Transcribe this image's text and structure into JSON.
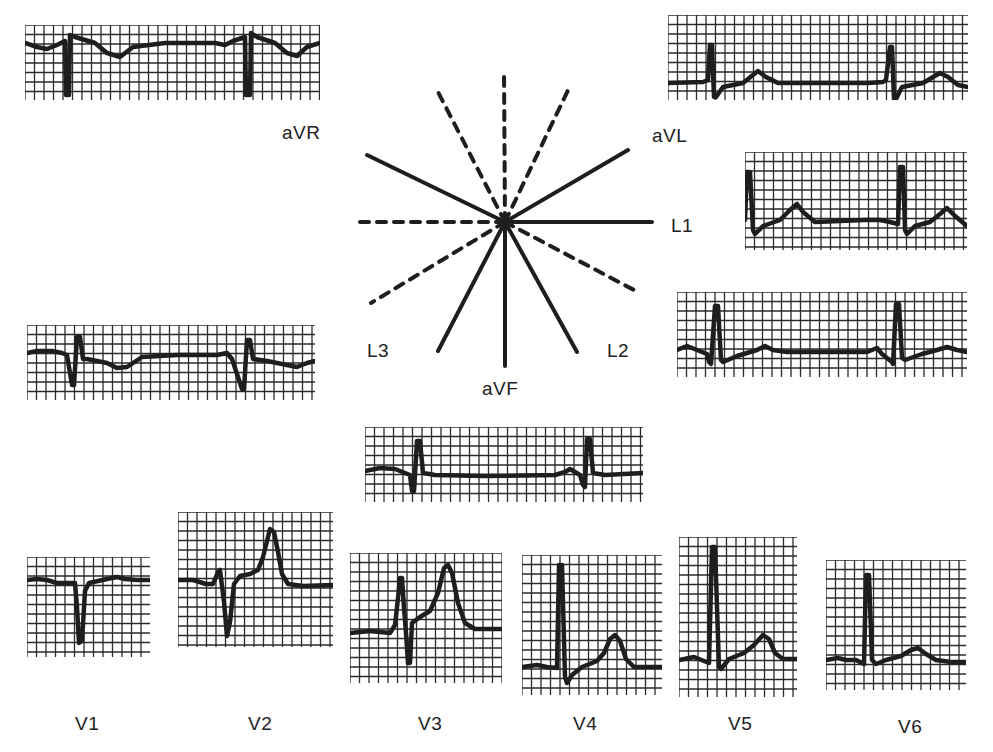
{
  "figure": {
    "colors": {
      "ink": "#1e1e1e",
      "grid": "#2a2a2a",
      "paper": "#ffffff"
    }
  },
  "axis_diagram": {
    "center": [
      505,
      222
    ],
    "solid_leads": [
      {
        "name": "aVR",
        "end": [
          367,
          155
        ]
      },
      {
        "name": "aVL",
        "end": [
          628,
          150
        ]
      },
      {
        "name": "L1",
        "end": [
          652,
          222
        ]
      },
      {
        "name": "L2",
        "end": [
          577,
          352
        ]
      },
      {
        "name": "aVF",
        "end": [
          505,
          366
        ]
      },
      {
        "name": "L3",
        "end": [
          438,
          351
        ]
      }
    ],
    "dashed_leads": [
      {
        "name": "neg-aVF",
        "end": [
          504,
          70
        ]
      },
      {
        "name": "neg-L2",
        "end": [
          437,
          90
        ]
      },
      {
        "name": "neg-L3",
        "end": [
          571,
          84
        ]
      },
      {
        "name": "neg-L1",
        "end": [
          352,
          222
        ]
      },
      {
        "name": "neg-aVL",
        "end": [
          371,
          303
        ]
      },
      {
        "name": "neg-aVR",
        "end": [
          634,
          290
        ]
      }
    ],
    "labels": [
      {
        "text": "aVR",
        "x": 282,
        "y": 122
      },
      {
        "text": "aVL",
        "x": 652,
        "y": 125
      },
      {
        "text": "L1",
        "x": 671,
        "y": 215
      },
      {
        "text": "L2",
        "x": 607,
        "y": 340
      },
      {
        "text": "L3",
        "x": 367,
        "y": 340
      },
      {
        "text": "aVF",
        "x": 482,
        "y": 378
      }
    ]
  },
  "strips": [
    {
      "lead": "aVR",
      "x": 25,
      "y": 25,
      "w": 295,
      "h": 75,
      "baseline": 18,
      "points": [
        [
          0,
          18
        ],
        [
          12,
          22
        ],
        [
          22,
          24
        ],
        [
          32,
          20
        ],
        [
          40,
          16
        ],
        [
          41,
          70
        ],
        [
          44,
          70
        ],
        [
          45,
          10
        ],
        [
          50,
          12
        ],
        [
          70,
          18
        ],
        [
          82,
          28
        ],
        [
          95,
          32
        ],
        [
          108,
          22
        ],
        [
          140,
          18
        ],
        [
          190,
          18
        ],
        [
          200,
          20
        ],
        [
          208,
          16
        ],
        [
          220,
          12
        ],
        [
          221,
          70
        ],
        [
          225,
          70
        ],
        [
          226,
          8
        ],
        [
          232,
          12
        ],
        [
          250,
          18
        ],
        [
          262,
          28
        ],
        [
          272,
          31
        ],
        [
          282,
          22
        ],
        [
          295,
          18
        ]
      ]
    },
    {
      "lead": "aVL",
      "x": 668,
      "y": 15,
      "w": 300,
      "h": 85,
      "baseline": 68,
      "points": [
        [
          0,
          68
        ],
        [
          35,
          67
        ],
        [
          40,
          65
        ],
        [
          42,
          30
        ],
        [
          44,
          30
        ],
        [
          46,
          82
        ],
        [
          48,
          82
        ],
        [
          55,
          72
        ],
        [
          75,
          68
        ],
        [
          85,
          60
        ],
        [
          90,
          56
        ],
        [
          98,
          62
        ],
        [
          110,
          68
        ],
        [
          200,
          68
        ],
        [
          215,
          67
        ],
        [
          218,
          65
        ],
        [
          222,
          32
        ],
        [
          224,
          32
        ],
        [
          226,
          84
        ],
        [
          228,
          84
        ],
        [
          234,
          72
        ],
        [
          255,
          68
        ],
        [
          265,
          62
        ],
        [
          272,
          58
        ],
        [
          280,
          62
        ],
        [
          290,
          70
        ],
        [
          300,
          72
        ]
      ]
    },
    {
      "lead": "L1",
      "x": 745,
      "y": 152,
      "w": 222,
      "h": 98,
      "baseline": 68,
      "points": [
        [
          0,
          68
        ],
        [
          2,
          20
        ],
        [
          5,
          20
        ],
        [
          8,
          78
        ],
        [
          10,
          82
        ],
        [
          18,
          74
        ],
        [
          35,
          68
        ],
        [
          45,
          58
        ],
        [
          52,
          52
        ],
        [
          58,
          60
        ],
        [
          70,
          70
        ],
        [
          120,
          68
        ],
        [
          135,
          68
        ],
        [
          145,
          70
        ],
        [
          153,
          72
        ],
        [
          155,
          15
        ],
        [
          158,
          15
        ],
        [
          160,
          78
        ],
        [
          162,
          82
        ],
        [
          170,
          74
        ],
        [
          185,
          70
        ],
        [
          195,
          62
        ],
        [
          202,
          56
        ],
        [
          210,
          64
        ],
        [
          222,
          74
        ]
      ]
    },
    {
      "lead": "L2",
      "x": 677,
      "y": 292,
      "w": 290,
      "h": 85,
      "baseline": 58,
      "points": [
        [
          0,
          58
        ],
        [
          10,
          54
        ],
        [
          20,
          58
        ],
        [
          30,
          62
        ],
        [
          32,
          70
        ],
        [
          34,
          72
        ],
        [
          38,
          14
        ],
        [
          41,
          14
        ],
        [
          44,
          68
        ],
        [
          46,
          70
        ],
        [
          60,
          64
        ],
        [
          80,
          58
        ],
        [
          88,
          54
        ],
        [
          96,
          58
        ],
        [
          110,
          60
        ],
        [
          180,
          60
        ],
        [
          190,
          60
        ],
        [
          200,
          56
        ],
        [
          205,
          62
        ],
        [
          215,
          70
        ],
        [
          216,
          72
        ],
        [
          219,
          12
        ],
        [
          222,
          12
        ],
        [
          225,
          66
        ],
        [
          228,
          68
        ],
        [
          245,
          62
        ],
        [
          260,
          58
        ],
        [
          270,
          55
        ],
        [
          280,
          58
        ],
        [
          290,
          60
        ]
      ]
    },
    {
      "lead": "L3",
      "x": 27,
      "y": 325,
      "w": 288,
      "h": 75,
      "baseline": 28,
      "points": [
        [
          0,
          28
        ],
        [
          10,
          26
        ],
        [
          25,
          26
        ],
        [
          35,
          28
        ],
        [
          40,
          30
        ],
        [
          45,
          60
        ],
        [
          47,
          60
        ],
        [
          50,
          12
        ],
        [
          53,
          12
        ],
        [
          56,
          34
        ],
        [
          60,
          34
        ],
        [
          80,
          38
        ],
        [
          90,
          43
        ],
        [
          100,
          42
        ],
        [
          115,
          32
        ],
        [
          150,
          30
        ],
        [
          190,
          30
        ],
        [
          200,
          28
        ],
        [
          205,
          34
        ],
        [
          215,
          64
        ],
        [
          217,
          64
        ],
        [
          220,
          15
        ],
        [
          223,
          15
        ],
        [
          226,
          34
        ],
        [
          240,
          36
        ],
        [
          260,
          40
        ],
        [
          270,
          42
        ],
        [
          280,
          38
        ],
        [
          288,
          36
        ]
      ]
    },
    {
      "lead": "aVF",
      "x": 365,
      "y": 427,
      "w": 278,
      "h": 75,
      "baseline": 46,
      "points": [
        [
          0,
          44
        ],
        [
          15,
          41
        ],
        [
          30,
          42
        ],
        [
          40,
          46
        ],
        [
          45,
          48
        ],
        [
          47,
          64
        ],
        [
          49,
          64
        ],
        [
          52,
          14
        ],
        [
          55,
          14
        ],
        [
          58,
          46
        ],
        [
          70,
          48
        ],
        [
          120,
          49
        ],
        [
          190,
          48
        ],
        [
          200,
          45
        ],
        [
          205,
          42
        ],
        [
          215,
          48
        ],
        [
          218,
          58
        ],
        [
          220,
          60
        ],
        [
          222,
          12
        ],
        [
          225,
          12
        ],
        [
          228,
          46
        ],
        [
          240,
          48
        ],
        [
          278,
          46
        ]
      ]
    },
    {
      "lead": "V1",
      "x": 27,
      "y": 557,
      "w": 123,
      "h": 100,
      "baseline": 23,
      "points": [
        [
          0,
          23
        ],
        [
          10,
          22
        ],
        [
          20,
          23
        ],
        [
          30,
          26
        ],
        [
          40,
          26
        ],
        [
          48,
          26
        ],
        [
          50,
          50
        ],
        [
          52,
          86
        ],
        [
          55,
          84
        ],
        [
          58,
          34
        ],
        [
          62,
          26
        ],
        [
          80,
          22
        ],
        [
          90,
          20
        ],
        [
          98,
          22
        ],
        [
          110,
          23
        ],
        [
          123,
          23
        ]
      ]
    },
    {
      "lead": "V2",
      "x": 178,
      "y": 512,
      "w": 155,
      "h": 135,
      "baseline": 68,
      "points": [
        [
          0,
          68
        ],
        [
          15,
          68
        ],
        [
          28,
          72
        ],
        [
          35,
          72
        ],
        [
          40,
          60
        ],
        [
          42,
          58
        ],
        [
          46,
          90
        ],
        [
          49,
          124
        ],
        [
          52,
          110
        ],
        [
          56,
          72
        ],
        [
          62,
          64
        ],
        [
          72,
          62
        ],
        [
          80,
          58
        ],
        [
          85,
          45
        ],
        [
          90,
          25
        ],
        [
          92,
          17
        ],
        [
          96,
          20
        ],
        [
          100,
          40
        ],
        [
          104,
          62
        ],
        [
          110,
          72
        ],
        [
          125,
          74
        ],
        [
          155,
          73
        ]
      ]
    },
    {
      "lead": "V3",
      "x": 350,
      "y": 553,
      "w": 152,
      "h": 130,
      "baseline": 78,
      "points": [
        [
          0,
          80
        ],
        [
          20,
          78
        ],
        [
          40,
          80
        ],
        [
          45,
          72
        ],
        [
          48,
          45
        ],
        [
          50,
          25
        ],
        [
          52,
          25
        ],
        [
          54,
          55
        ],
        [
          56,
          80
        ],
        [
          58,
          110
        ],
        [
          60,
          110
        ],
        [
          62,
          70
        ],
        [
          70,
          64
        ],
        [
          80,
          58
        ],
        [
          88,
          40
        ],
        [
          94,
          15
        ],
        [
          98,
          12
        ],
        [
          102,
          20
        ],
        [
          108,
          50
        ],
        [
          115,
          70
        ],
        [
          125,
          76
        ],
        [
          152,
          76
        ]
      ]
    },
    {
      "lead": "V4",
      "x": 522,
      "y": 555,
      "w": 140,
      "h": 140,
      "baseline": 112,
      "points": [
        [
          0,
          112
        ],
        [
          15,
          110
        ],
        [
          25,
          112
        ],
        [
          35,
          113
        ],
        [
          37,
          10
        ],
        [
          40,
          10
        ],
        [
          43,
          122
        ],
        [
          45,
          128
        ],
        [
          50,
          120
        ],
        [
          60,
          112
        ],
        [
          75,
          106
        ],
        [
          82,
          98
        ],
        [
          88,
          84
        ],
        [
          93,
          80
        ],
        [
          98,
          86
        ],
        [
          104,
          104
        ],
        [
          112,
          112
        ],
        [
          140,
          112
        ]
      ]
    },
    {
      "lead": "V5",
      "x": 679,
      "y": 537,
      "w": 118,
      "h": 160,
      "baseline": 122,
      "points": [
        [
          0,
          123
        ],
        [
          15,
          120
        ],
        [
          25,
          124
        ],
        [
          30,
          126
        ],
        [
          33,
          10
        ],
        [
          36,
          10
        ],
        [
          40,
          130
        ],
        [
          42,
          132
        ],
        [
          50,
          122
        ],
        [
          65,
          116
        ],
        [
          75,
          108
        ],
        [
          84,
          98
        ],
        [
          90,
          102
        ],
        [
          96,
          116
        ],
        [
          104,
          122
        ],
        [
          118,
          122
        ]
      ]
    },
    {
      "lead": "V6",
      "x": 826,
      "y": 560,
      "w": 140,
      "h": 130,
      "baseline": 100,
      "points": [
        [
          0,
          100
        ],
        [
          12,
          98
        ],
        [
          20,
          100
        ],
        [
          30,
          100
        ],
        [
          38,
          104
        ],
        [
          40,
          15
        ],
        [
          43,
          15
        ],
        [
          46,
          100
        ],
        [
          50,
          104
        ],
        [
          60,
          100
        ],
        [
          75,
          96
        ],
        [
          85,
          90
        ],
        [
          92,
          88
        ],
        [
          100,
          94
        ],
        [
          110,
          100
        ],
        [
          125,
          102
        ],
        [
          140,
          102
        ]
      ]
    }
  ],
  "precordial_labels": [
    {
      "text": "V1",
      "x": 75,
      "y": 713
    },
    {
      "text": "V2",
      "x": 248,
      "y": 713
    },
    {
      "text": "V3",
      "x": 418,
      "y": 713
    },
    {
      "text": "V4",
      "x": 573,
      "y": 713
    },
    {
      "text": "V5",
      "x": 728,
      "y": 713
    },
    {
      "text": "V6",
      "x": 898,
      "y": 716
    }
  ]
}
